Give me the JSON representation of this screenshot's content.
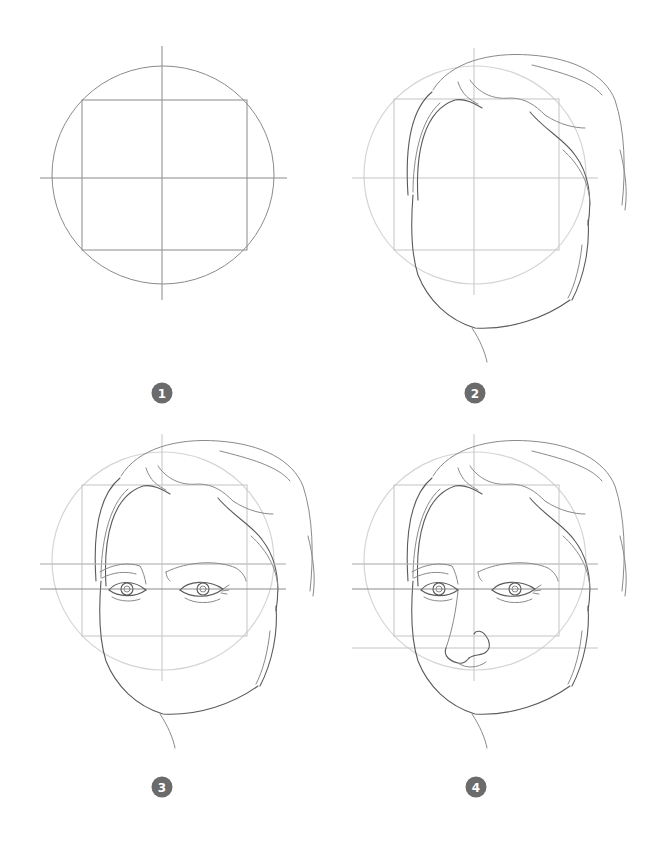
{
  "illustration": {
    "subject": "Step-by-step guide to drawing a face from the front",
    "background_color": "#ffffff",
    "line_color": "#5a5a5a",
    "badge_color": "#6b6b6b",
    "steps": [
      {
        "number": "1",
        "description": "Circle with square and cross guide lines"
      },
      {
        "number": "2",
        "description": "Hair and face outline over guides"
      },
      {
        "number": "3",
        "description": "Eyes and eyebrows added"
      },
      {
        "number": "4",
        "description": "Nose added"
      }
    ]
  }
}
